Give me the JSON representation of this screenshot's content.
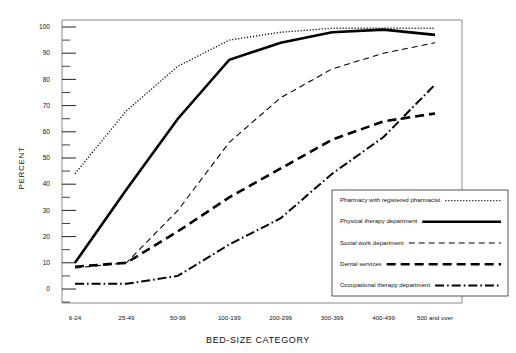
{
  "chart_data": {
    "type": "line",
    "title": "",
    "xlabel": "BED-SIZE CATEGORY",
    "ylabel": "PERCENT",
    "categories": [
      "6-24",
      "25-49",
      "50-99",
      "100-199",
      "200-299",
      "300-399",
      "400-499",
      "500 and over"
    ],
    "ylim": [
      0,
      100
    ],
    "ytick_labels": [
      "0",
      "10",
      "20",
      "30",
      "40",
      "50",
      "60",
      "70",
      "80",
      "90",
      "100"
    ],
    "ytick_values": [
      0,
      10,
      20,
      30,
      40,
      50,
      60,
      70,
      80,
      90,
      100
    ],
    "minor_tick_interval": 5,
    "grid": false,
    "legend_position": "lower-right",
    "series": [
      {
        "name": "Pharmacy with registered pharmacist",
        "style": "dotted",
        "values": [
          44,
          68,
          85,
          95,
          98,
          99.5,
          99.5,
          99.5
        ]
      },
      {
        "name": "Physical therapy department",
        "style": "solid-thick",
        "values": [
          10,
          38,
          65,
          87.5,
          94,
          98,
          99,
          97
        ]
      },
      {
        "name": "Social work department",
        "style": "dashed-thin",
        "values": [
          8,
          10,
          30,
          56,
          73,
          84,
          90,
          94
        ]
      },
      {
        "name": "Dental services",
        "style": "dashed-thick",
        "values": [
          8.5,
          10,
          22,
          35,
          46,
          57,
          64,
          67
        ]
      },
      {
        "name": "Occupational therapy department",
        "style": "dash-dot",
        "values": [
          2,
          2,
          5,
          17,
          27,
          44,
          58,
          78
        ]
      }
    ]
  },
  "legend": {
    "entries": [
      {
        "label": "Pharmacy with registered pharmacist",
        "style": "dotted"
      },
      {
        "label": "Physical therapy department",
        "style": "solid-thick"
      },
      {
        "label": "Social work department",
        "style": "dashed-thin"
      },
      {
        "label": "Dental services",
        "style": "dashed-thick"
      },
      {
        "label": "Occupational therapy department",
        "style": "dash-dot"
      }
    ]
  },
  "colors": {
    "ink": "#000000",
    "frame": "#8a8a8a",
    "background": "#ffffff"
  }
}
